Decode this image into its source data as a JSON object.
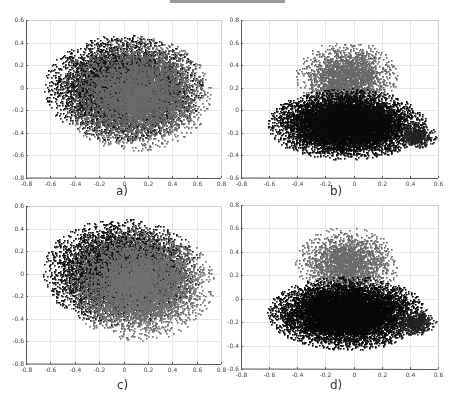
{
  "figure": {
    "top_bar_color": "#9a9a9a"
  },
  "chart_data": [
    {
      "type": "scatter",
      "panel_label": "a)",
      "title": "",
      "xlabel": "",
      "ylabel": "",
      "xlim": [
        -0.8,
        0.8
      ],
      "ylim": [
        -0.8,
        0.6
      ],
      "xticks": [
        "-0.8",
        "-0.6",
        "-0.4",
        "-0.2",
        "0",
        "0.2",
        "0.4",
        "0.6",
        "0.8"
      ],
      "yticks": [
        "-0.8",
        "-0.6",
        "-0.4",
        "-0.2",
        "0",
        "0.2",
        "0.4",
        "0.6"
      ],
      "grid": true,
      "legend": null,
      "series": [
        {
          "name": "dark points",
          "color": "#111111",
          "distribution": "ellipse",
          "center": [
            0.0,
            0.0
          ],
          "radius": [
            0.58,
            0.42
          ],
          "count": 9000
        },
        {
          "name": "gray points",
          "color": "#6a6a6a",
          "distribution": "ellipse",
          "center": [
            0.1,
            -0.05
          ],
          "radius": [
            0.55,
            0.45
          ],
          "count": 6000
        }
      ],
      "extent_observed": {
        "x": [
          -0.66,
          0.64
        ],
        "y": [
          -0.62,
          0.58
        ]
      }
    },
    {
      "type": "scatter",
      "panel_label": "b)",
      "title": "",
      "xlabel": "",
      "ylabel": "",
      "xlim": [
        -0.8,
        0.6
      ],
      "ylim": [
        -0.6,
        0.8
      ],
      "xticks": [
        "-0.8",
        "-0.6",
        "-0.4",
        "-0.2",
        "0",
        "0.2",
        "0.4",
        "0.6"
      ],
      "yticks": [
        "-0.6",
        "-0.4",
        "-0.2",
        "0",
        "0.2",
        "0.4",
        "0.6",
        "0.8"
      ],
      "grid": true,
      "legend": null,
      "series": [
        {
          "name": "upper gray cluster",
          "color": "#666666",
          "distribution": "ellipse",
          "center": [
            -0.05,
            0.3
          ],
          "radius": [
            0.33,
            0.28
          ],
          "count": 2500
        },
        {
          "name": "lower dark cluster",
          "color": "#0a0a0a",
          "distribution": "ellipse",
          "center": [
            -0.05,
            -0.12
          ],
          "radius": [
            0.5,
            0.28
          ],
          "count": 11000
        },
        {
          "name": "right tail",
          "color": "#222222",
          "distribution": "ellipse",
          "center": [
            0.45,
            -0.22
          ],
          "radius": [
            0.12,
            0.1
          ],
          "count": 500
        }
      ],
      "extent_observed": {
        "x": [
          -0.62,
          0.58
        ],
        "y": [
          -0.52,
          0.6
        ]
      }
    },
    {
      "type": "scatter",
      "panel_label": "c)",
      "title": "",
      "xlabel": "",
      "ylabel": "",
      "xlim": [
        -0.8,
        0.8
      ],
      "ylim": [
        -0.8,
        0.6
      ],
      "xticks": [
        "-0.8",
        "-0.6",
        "-0.4",
        "-0.2",
        "0",
        "0.2",
        "0.4",
        "0.6",
        "0.8"
      ],
      "yticks": [
        "-0.8",
        "-0.6",
        "-0.4",
        "-0.2",
        "0",
        "0.2",
        "0.4",
        "0.6"
      ],
      "grid": true,
      "legend": null,
      "series": [
        {
          "name": "dark points",
          "color": "#111111",
          "distribution": "ellipse",
          "center": [
            -0.02,
            0.02
          ],
          "radius": [
            0.58,
            0.42
          ],
          "count": 8500
        },
        {
          "name": "gray points",
          "color": "#707070",
          "distribution": "ellipse",
          "center": [
            0.12,
            -0.08
          ],
          "radius": [
            0.55,
            0.45
          ],
          "count": 6500
        }
      ],
      "extent_observed": {
        "x": [
          -0.66,
          0.64
        ],
        "y": [
          -0.62,
          0.58
        ]
      }
    },
    {
      "type": "scatter",
      "panel_label": "d)",
      "title": "",
      "xlabel": "",
      "ylabel": "",
      "xlim": [
        -0.8,
        0.6
      ],
      "ylim": [
        -0.6,
        0.8
      ],
      "xticks": [
        "-0.8",
        "-0.6",
        "-0.4",
        "-0.2",
        "0",
        "0.2",
        "0.4",
        "0.6"
      ],
      "yticks": [
        "-0.6",
        "-0.4",
        "-0.2",
        "0",
        "0.2",
        "0.4",
        "0.6",
        "0.8"
      ],
      "grid": true,
      "legend": null,
      "series": [
        {
          "name": "upper gray cluster",
          "color": "#6a6a6a",
          "distribution": "ellipse",
          "center": [
            -0.05,
            0.3
          ],
          "radius": [
            0.33,
            0.28
          ],
          "count": 2500
        },
        {
          "name": "lower dark cluster",
          "color": "#080808",
          "distribution": "ellipse",
          "center": [
            -0.05,
            -0.12
          ],
          "radius": [
            0.5,
            0.28
          ],
          "count": 11000
        },
        {
          "name": "right tail",
          "color": "#222222",
          "distribution": "ellipse",
          "center": [
            0.45,
            -0.2
          ],
          "radius": [
            0.12,
            0.1
          ],
          "count": 500
        }
      ],
      "extent_observed": {
        "x": [
          -0.62,
          0.58
        ],
        "y": [
          -0.52,
          0.6
        ]
      }
    }
  ]
}
